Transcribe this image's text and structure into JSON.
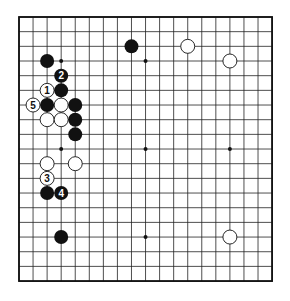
{
  "board": {
    "size": 19,
    "origin": {
      "x": 19,
      "y": 17
    },
    "cell": {
      "w": 14.06,
      "h": 14.67
    },
    "line_color": "#222222",
    "border_color": "#111111",
    "background": "#ffffff",
    "star_points": [
      [
        3,
        3
      ],
      [
        9,
        3
      ],
      [
        15,
        3
      ],
      [
        3,
        9
      ],
      [
        9,
        9
      ],
      [
        15,
        9
      ],
      [
        3,
        15
      ],
      [
        9,
        15
      ],
      [
        15,
        15
      ]
    ]
  },
  "stones": [
    {
      "color": "black",
      "col": 2,
      "row": 3,
      "label": ""
    },
    {
      "color": "black",
      "col": 8,
      "row": 2,
      "label": ""
    },
    {
      "color": "white",
      "col": 12,
      "row": 2,
      "label": ""
    },
    {
      "color": "white",
      "col": 15,
      "row": 3,
      "label": ""
    },
    {
      "color": "black",
      "col": 3,
      "row": 4,
      "label": "2"
    },
    {
      "color": "white",
      "col": 2,
      "row": 5,
      "label": "1"
    },
    {
      "color": "black",
      "col": 3,
      "row": 5,
      "label": ""
    },
    {
      "color": "white",
      "col": 1,
      "row": 6,
      "label": "5"
    },
    {
      "color": "black",
      "col": 2,
      "row": 6,
      "label": ""
    },
    {
      "color": "white",
      "col": 3,
      "row": 6,
      "label": ""
    },
    {
      "color": "black",
      "col": 4,
      "row": 6,
      "label": ""
    },
    {
      "color": "white",
      "col": 2,
      "row": 7,
      "label": ""
    },
    {
      "color": "white",
      "col": 3,
      "row": 7,
      "label": ""
    },
    {
      "color": "black",
      "col": 4,
      "row": 7,
      "label": ""
    },
    {
      "color": "black",
      "col": 4,
      "row": 8,
      "label": ""
    },
    {
      "color": "white",
      "col": 2,
      "row": 10,
      "label": ""
    },
    {
      "color": "white",
      "col": 4,
      "row": 10,
      "label": ""
    },
    {
      "color": "white",
      "col": 2,
      "row": 11,
      "label": "3"
    },
    {
      "color": "black",
      "col": 2,
      "row": 12,
      "label": ""
    },
    {
      "color": "black",
      "col": 3,
      "row": 12,
      "label": "4"
    },
    {
      "color": "black",
      "col": 3,
      "row": 15,
      "label": ""
    },
    {
      "color": "white",
      "col": 15,
      "row": 15,
      "label": ""
    }
  ]
}
